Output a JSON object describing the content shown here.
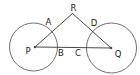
{
  "diagram": {
    "labels": {
      "top_vertex": "R",
      "left_circle_upper": "A",
      "left_circle_right": "B",
      "right_circle_left": "C",
      "right_circle_upper": "D",
      "left_center": "P",
      "right_center": "Q"
    },
    "colors": {
      "background": "#ffffff",
      "line": "#4a4a4a",
      "circle_outline": "#707070",
      "label_text": "#1b1b1b"
    }
  }
}
